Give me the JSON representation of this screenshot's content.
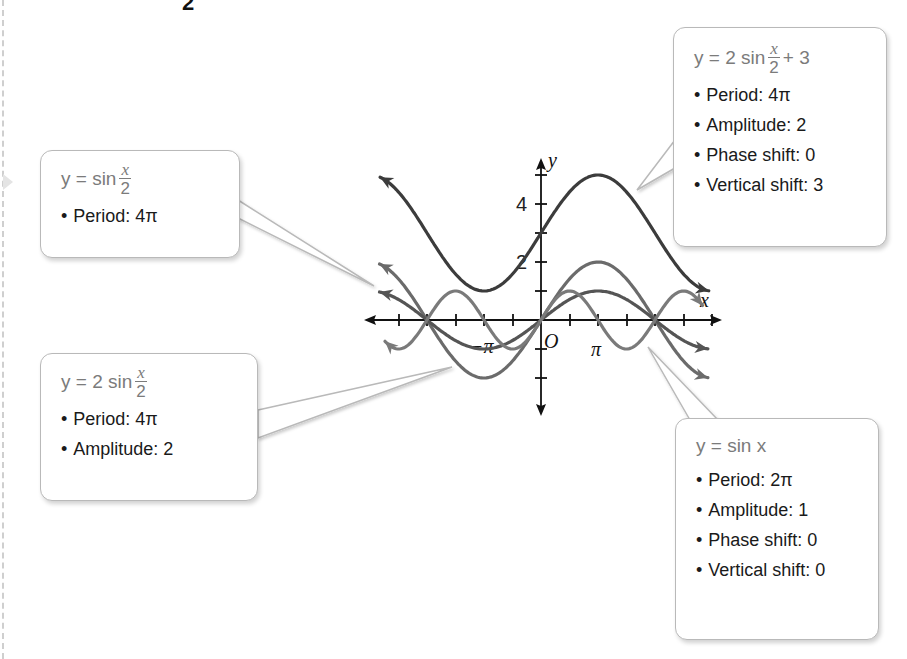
{
  "top_fragment": "2",
  "colors": {
    "axis": "#111111",
    "curve_vertical_shift": "#3c3c3c",
    "curve_2sin_half": "#6b6b6b",
    "curve_sin_half": "#555555",
    "curve_sin_x": "#7a7a7a",
    "callout_border": "#b9b9b9",
    "equation_text": "#7b7b7b"
  },
  "axes": {
    "x_label": "x",
    "y_label": "y",
    "origin_label": "O",
    "x_tick_labels": [
      {
        "label": "−π",
        "value": -3.14159
      },
      {
        "label": "π",
        "value": 3.14159
      }
    ],
    "y_tick_labels": [
      {
        "label": "2",
        "value": 2
      },
      {
        "label": "4",
        "value": 4
      }
    ]
  },
  "callouts": {
    "sin_half": {
      "eq_prefix": "y = sin",
      "eq_num": "x",
      "eq_den": "2",
      "eq_suffix": "",
      "props": [
        "Period: 4π"
      ]
    },
    "two_sin_half": {
      "eq_prefix": "y = 2 sin",
      "eq_num": "x",
      "eq_den": "2",
      "eq_suffix": "",
      "props": [
        "Period: 4π",
        "Amplitude: 2"
      ]
    },
    "two_sin_half_plus3": {
      "eq_prefix": "y = 2 sin",
      "eq_num": "x",
      "eq_den": "2",
      "eq_suffix": "+ 3",
      "props": [
        "Period: 4π",
        "Amplitude: 2",
        "Phase shift: 0",
        "Vertical shift: 3"
      ]
    },
    "sin_x": {
      "eq_prefix": "y = sin x",
      "props": [
        "Period: 2π",
        "Amplitude: 1",
        "Phase shift: 0",
        "Vertical shift: 0"
      ]
    }
  },
  "chart_data": {
    "type": "line",
    "title": "",
    "xlabel": "x",
    "ylabel": "y",
    "xlim": [
      -8.9,
      9.3
    ],
    "ylim": [
      -3,
      5.5
    ],
    "grid": false,
    "x_tick_step": "π/2",
    "y_tick_step": 1,
    "series": [
      {
        "name": "y = 2 sin(x/2) + 3",
        "formula": "2*sin(x/2)+3",
        "period": "4π",
        "amplitude": 2,
        "phase_shift": 0,
        "vertical_shift": 3,
        "points": [
          [
            -6.283,
            3
          ],
          [
            -3.1416,
            1
          ],
          [
            0,
            3
          ],
          [
            3.1416,
            5
          ],
          [
            6.283,
            3
          ]
        ]
      },
      {
        "name": "y = 2 sin(x/2)",
        "formula": "2*sin(x/2)",
        "period": "4π",
        "amplitude": 2,
        "points": [
          [
            -6.283,
            0
          ],
          [
            -3.1416,
            -2
          ],
          [
            0,
            0
          ],
          [
            3.1416,
            2
          ],
          [
            6.283,
            0
          ]
        ]
      },
      {
        "name": "y = sin(x/2)",
        "formula": "sin(x/2)",
        "period": "4π",
        "amplitude": 1,
        "points": [
          [
            -6.283,
            0
          ],
          [
            -3.1416,
            -1
          ],
          [
            0,
            0
          ],
          [
            3.1416,
            1
          ],
          [
            6.283,
            0
          ]
        ]
      },
      {
        "name": "y = sin x",
        "formula": "sin(x)",
        "period": "2π",
        "amplitude": 1,
        "phase_shift": 0,
        "vertical_shift": 0,
        "points": [
          [
            -6.283,
            0
          ],
          [
            -4.712,
            1
          ],
          [
            -3.1416,
            0
          ],
          [
            -1.5708,
            -1
          ],
          [
            0,
            0
          ],
          [
            1.5708,
            1
          ],
          [
            3.1416,
            0
          ],
          [
            4.712,
            -1
          ],
          [
            6.283,
            0
          ]
        ]
      }
    ]
  }
}
